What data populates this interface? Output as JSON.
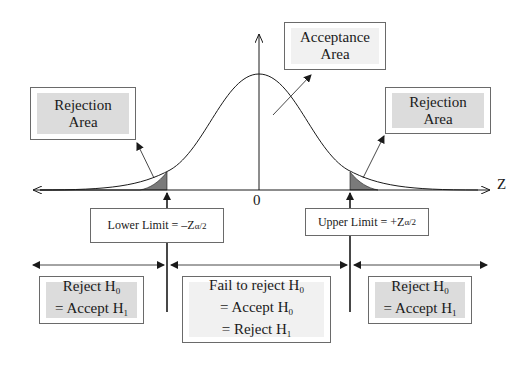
{
  "diagram": {
    "type": "two-tailed hypothesis test on standard normal distribution",
    "axis": {
      "x_label": "Z",
      "origin_label": "0"
    },
    "colors": {
      "shaded_tail": "#7a7a7a",
      "box_fill": "#dcdcdc",
      "line": "#1a1a1a"
    },
    "callouts": {
      "rejection_left": {
        "line1": "Rejection",
        "line2": "Area"
      },
      "acceptance": {
        "line1": "Acceptance",
        "line2": "Area"
      },
      "rejection_right": {
        "line1": "Rejection",
        "line2": "Area"
      }
    },
    "limits": {
      "lower": {
        "text": "Lower Limit = –Z",
        "subscript": "α/2"
      },
      "upper": {
        "text": "Upper Limit = +Z",
        "subscript": "α/2"
      }
    },
    "decisions": {
      "left": {
        "line1": "Reject H",
        "line1_sub": "0",
        "line2": "= Accept H",
        "line2_sub": "1"
      },
      "center": {
        "line1": "Fail to reject H",
        "line1_sub": "0",
        "line2": "= Accept H",
        "line2_sub": "0",
        "line3": "= Reject H",
        "line3_sub": "1"
      },
      "right": {
        "line1": "Reject H",
        "line1_sub": "0",
        "line2": "= Accept H",
        "line2_sub": "1"
      }
    }
  }
}
